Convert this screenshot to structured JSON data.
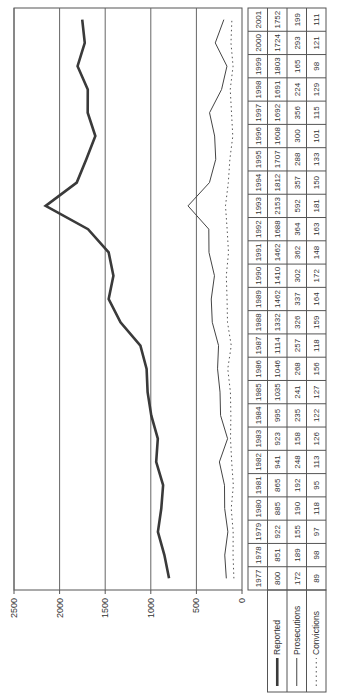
{
  "chart_data": {
    "type": "line",
    "orientation": "rotated-90-ccw",
    "title": "",
    "xlabel": "",
    "ylabel": "",
    "ylim": [
      0,
      2500
    ],
    "yticks": [
      0,
      500,
      1000,
      1500,
      2000,
      2500
    ],
    "grid": true,
    "legend_position": "left of data table",
    "x": [
      "1977",
      "1978",
      "1979",
      "1980",
      "1981",
      "1982",
      "1983",
      "1984",
      "1985",
      "1986",
      "1987",
      "1988",
      "1989",
      "1990",
      "1991",
      "1992",
      "1993",
      "1994",
      "1995",
      "1996",
      "1997",
      "1998",
      "1999",
      "2000",
      "2001"
    ],
    "series": [
      {
        "name": "Reported",
        "style": "thick-solid",
        "values": [
          800,
          851,
          922,
          885,
          865,
          941,
          923,
          995,
          1035,
          1046,
          1114,
          1332,
          1462,
          1410,
          1462,
          1688,
          2153,
          1812,
          1707,
          1608,
          1692,
          1691,
          1803,
          1724,
          1752
        ]
      },
      {
        "name": "Prosecutions",
        "style": "thin-solid",
        "values": [
          172,
          189,
          155,
          190,
          192,
          248,
          158,
          235,
          241,
          268,
          257,
          326,
          337,
          302,
          362,
          364,
          592,
          357,
          288,
          300,
          356,
          224,
          165,
          293,
          199
        ]
      },
      {
        "name": "Convictions",
        "style": "dotted",
        "values": [
          89,
          98,
          97,
          118,
          95,
          113,
          126,
          122,
          127,
          156,
          118,
          159,
          164,
          172,
          148,
          163,
          181,
          150,
          133,
          101,
          115,
          129,
          98,
          121,
          111
        ]
      }
    ]
  },
  "table": {
    "row_labels": [
      "Reported",
      "Prosecutions",
      "Convictions"
    ]
  }
}
